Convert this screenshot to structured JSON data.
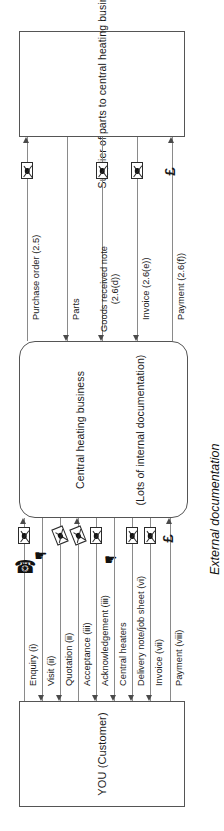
{
  "diagram": {
    "caption": "External documentation",
    "orientation_note": "rotated",
    "boxes": {
      "supplier": {
        "label": "Supplier of parts to central heating business"
      },
      "business": {
        "label": "Central heating business",
        "sublabel": "(Lots of internal documentation)"
      },
      "customer": {
        "label": "YOU (Customer)"
      }
    },
    "upper_flows": [
      {
        "label": "Purchase order (2.5)",
        "icon": "envelope-icon",
        "direction": "to-supplier"
      },
      {
        "label": "Parts",
        "icon": "none",
        "direction": "to-business"
      },
      {
        "label": "Goods received note (2.6(d))",
        "icon": "envelope-icon",
        "direction": "to-business"
      },
      {
        "label": "Invoice (2.6(e))",
        "icon": "envelope-icon",
        "direction": "to-business"
      },
      {
        "label": "Payment (2.6(f))",
        "icon": "pound-icon",
        "direction": "to-supplier"
      }
    ],
    "lower_flows": [
      {
        "label": "Enquiry (i)",
        "icons": [
          "envelope-icon",
          "telephone-icon"
        ],
        "direction": "to-business"
      },
      {
        "label": "Visit (ii)",
        "icons": [
          "person-icon"
        ],
        "direction": "to-customer"
      },
      {
        "label": "Quotation (ii)",
        "icons": [
          "envelope-open-icon"
        ],
        "direction": "to-customer"
      },
      {
        "label": "Acceptance (iii)",
        "icons": [
          "envelope-open-icon"
        ],
        "direction": "to-business"
      },
      {
        "label": "Acknowledgement (iii)",
        "icons": [
          "envelope-icon",
          "person-icon"
        ],
        "direction": "to-customer"
      },
      {
        "label": "Central heaters",
        "icons": [],
        "direction": "to-customer"
      },
      {
        "label": "Delivery note/job sheet (vi)",
        "icons": [
          "envelope-icon"
        ],
        "direction": "to-customer"
      },
      {
        "label": "Invoice (vii)",
        "icons": [
          "envelope-icon"
        ],
        "direction": "to-customer"
      },
      {
        "label": "Payment (viii)",
        "icons": [
          "pound-icon"
        ],
        "direction": "to-business"
      }
    ]
  }
}
